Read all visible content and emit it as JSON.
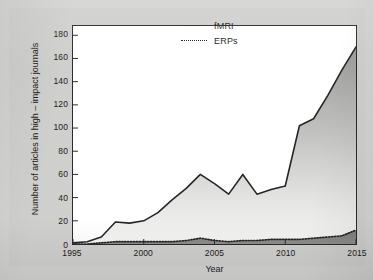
{
  "figure": {
    "background_color": "#cfcfcd",
    "plot_background_color": "#ffffff",
    "frame_color": "#2b2b2b"
  },
  "legend": {
    "position": "top-right-inside",
    "items": [
      {
        "label": "fMRI",
        "style": "solid",
        "color": "#262626"
      },
      {
        "label": "ERPs",
        "style": "dotted",
        "color": "#262626"
      }
    ]
  },
  "chart_data": {
    "type": "area",
    "title": "",
    "subtitle": "",
    "xlabel": "Year",
    "ylabel": "Number of articles in high – impact journals",
    "xlim": [
      1995,
      2015
    ],
    "ylim": [
      0,
      188
    ],
    "xticks": [
      1995,
      2000,
      2005,
      2010,
      2015
    ],
    "yticks": [
      0,
      20,
      40,
      60,
      80,
      100,
      120,
      140,
      160,
      180
    ],
    "grid": false,
    "legend_position": "upper right",
    "fill": "gradient-gray",
    "x": [
      1995,
      1996,
      1997,
      1998,
      1999,
      2000,
      2001,
      2002,
      2003,
      2004,
      2005,
      2006,
      2007,
      2008,
      2009,
      2010,
      2011,
      2012,
      2013,
      2014,
      2015
    ],
    "series": [
      {
        "name": "fMRI",
        "style": "solid",
        "color": "#262626",
        "values": [
          1,
          2,
          6,
          19,
          18,
          20,
          27,
          38,
          48,
          60,
          52,
          43,
          60,
          43,
          47,
          50,
          102,
          108,
          128,
          150,
          170
        ]
      },
      {
        "name": "ERPs",
        "style": "dotted",
        "color": "#262626",
        "values": [
          0,
          0,
          1,
          2,
          2,
          2,
          2,
          2,
          3,
          5,
          3,
          2,
          3,
          3,
          4,
          4,
          4,
          5,
          6,
          7,
          12
        ]
      }
    ]
  }
}
